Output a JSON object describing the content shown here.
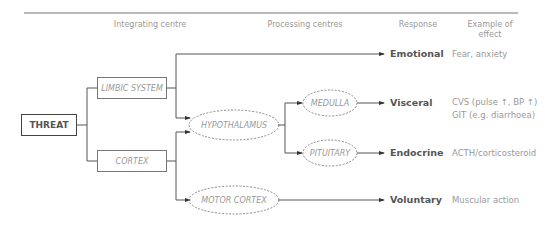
{
  "headers": {
    "integrating": "Integrating centre",
    "processing": "Processing centres",
    "response": "Response",
    "effect": "Example of effect"
  },
  "nodes": {
    "threat": "THREAT",
    "limbic": "LIMBIC SYSTEM",
    "cortex": "CORTEX",
    "hypothalamus": "HYPOTHALAMUS",
    "motor_cortex": "MOTOR CORTEX",
    "medulla": "MEDULLA",
    "pituitary": "PITUITARY"
  },
  "responses": [
    {
      "label": "Emotional",
      "effect": [
        "Fear, anxiety"
      ]
    },
    {
      "label": "Visceral",
      "effect": [
        "CVS (pulse ↑, BP ↑)",
        "GIT (e.g. diarrhoea)"
      ]
    },
    {
      "label": "Endocrine",
      "effect": [
        "ACTH/corticosteroid"
      ]
    },
    {
      "label": "Voluntary",
      "effect": [
        "Muscular action"
      ]
    }
  ]
}
